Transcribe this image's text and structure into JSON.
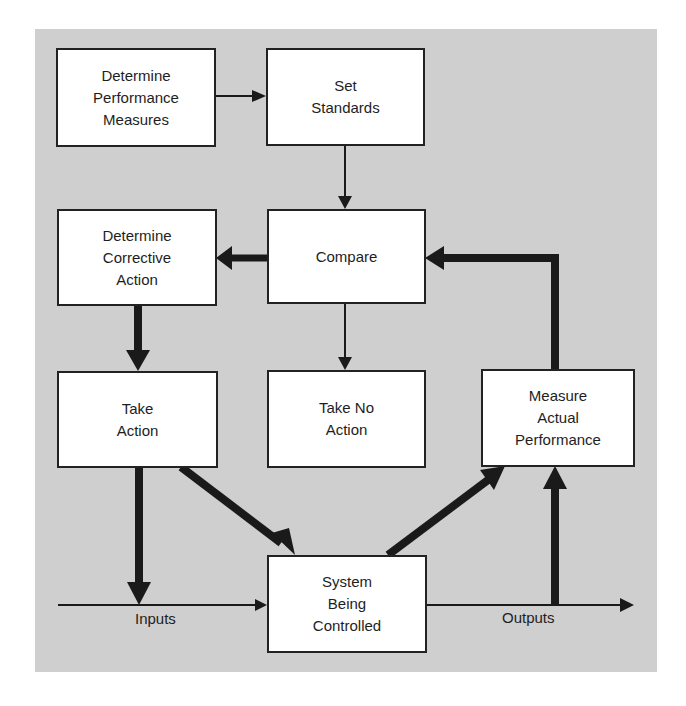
{
  "diagram": {
    "colors": {
      "background_panel": "#cfcfcf",
      "box_fill": "#ffffff",
      "line": "#1a1a1a"
    },
    "boxes": [
      {
        "id": "determine-performance-measures",
        "label": "Determine\nPerformance\nMeasures"
      },
      {
        "id": "set-standards",
        "label": "Set\nStandards"
      },
      {
        "id": "compare",
        "label": "Compare"
      },
      {
        "id": "determine-corrective-action",
        "label": "Determine\nCorrective\nAction"
      },
      {
        "id": "take-action",
        "label": "Take\nAction"
      },
      {
        "id": "take-no-action",
        "label": "Take No\nAction"
      },
      {
        "id": "measure-actual-performance",
        "label": "Measure\nActual\nPerformance"
      },
      {
        "id": "system-being-controlled",
        "label": "System\nBeing\nControlled"
      }
    ],
    "labels": {
      "inputs": "Inputs",
      "outputs": "Outputs"
    },
    "edges": [
      {
        "from": "determine-performance-measures",
        "to": "set-standards",
        "weight": "thin"
      },
      {
        "from": "set-standards",
        "to": "compare",
        "weight": "thin"
      },
      {
        "from": "compare",
        "to": "determine-corrective-action",
        "weight": "thick"
      },
      {
        "from": "compare",
        "to": "take-no-action",
        "weight": "thin"
      },
      {
        "from": "determine-corrective-action",
        "to": "take-action",
        "weight": "thick"
      },
      {
        "from": "take-action",
        "to": "system-being-controlled",
        "weight": "thick"
      },
      {
        "from": "take-action",
        "to": "inputs",
        "weight": "thick"
      },
      {
        "from": "inputs",
        "to": "system-being-controlled",
        "weight": "thin"
      },
      {
        "from": "system-being-controlled",
        "to": "measure-actual-performance",
        "weight": "thick"
      },
      {
        "from": "outputs",
        "to": "measure-actual-performance",
        "weight": "thick"
      },
      {
        "from": "measure-actual-performance",
        "to": "compare",
        "weight": "thick"
      },
      {
        "from": "system-being-controlled",
        "to": "outputs",
        "weight": "thin"
      }
    ]
  }
}
